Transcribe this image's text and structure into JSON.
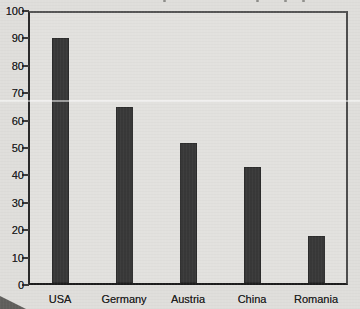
{
  "figure": {
    "background_color": "#dfdedb",
    "plot_background_color": "#e2e1de",
    "bar_color": "#383838",
    "axis_color": "#2b2b2b",
    "text_color": "#1d1d1d",
    "title_visible_text": ""
  },
  "chart_data": {
    "type": "bar",
    "title": "",
    "xlabel": "",
    "ylabel": "",
    "categories": [
      "USA",
      "Germany",
      "Austria",
      "China",
      "Romania"
    ],
    "values": [
      90,
      65,
      52,
      43,
      18
    ],
    "ylim": [
      0,
      100
    ],
    "yticks": [
      0,
      10,
      20,
      30,
      40,
      50,
      60,
      70,
      80,
      90,
      100
    ],
    "grid": false,
    "legend": null
  }
}
